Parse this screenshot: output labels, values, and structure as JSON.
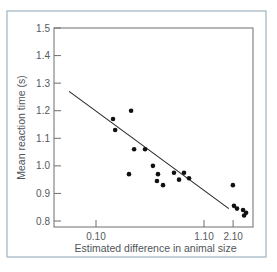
{
  "colors": {
    "frame": "#9fb3bf",
    "plot_border": "#6e6e6e",
    "axis": "#6e6e6e",
    "point": "#111111",
    "line": "#2a2a2a",
    "text": "#555a5e"
  },
  "chart_data": {
    "type": "scatter",
    "title": "",
    "xlabel": "Estimated difference in animal size",
    "ylabel": "Mean reaction time (s)",
    "xscale": "log",
    "xlim": [
      0.04,
      3.5
    ],
    "ylim": [
      0.8,
      1.5
    ],
    "grid": false,
    "legend": null,
    "x_ticks": [
      {
        "value": 0.1,
        "label": "0.10"
      },
      {
        "value": 1.1,
        "label": "1.10"
      },
      {
        "value": 2.1,
        "label": "2.10"
      }
    ],
    "y_ticks": [
      {
        "value": 0.8,
        "label": "0.8"
      },
      {
        "value": 0.9,
        "label": "0.9"
      },
      {
        "value": 1.0,
        "label": "1.0"
      },
      {
        "value": 1.1,
        "label": "1.1"
      },
      {
        "value": 1.2,
        "label": "1.2"
      },
      {
        "value": 1.3,
        "label": "1.3"
      },
      {
        "value": 1.4,
        "label": "1.4"
      },
      {
        "value": 1.5,
        "label": "1.5"
      }
    ],
    "series": [
      {
        "name": "observations",
        "points": [
          {
            "x": 0.146,
            "y": 1.17
          },
          {
            "x": 0.218,
            "y": 1.2
          },
          {
            "x": 0.153,
            "y": 1.13
          },
          {
            "x": 0.233,
            "y": 1.06
          },
          {
            "x": 0.297,
            "y": 1.06
          },
          {
            "x": 0.208,
            "y": 0.97
          },
          {
            "x": 0.354,
            "y": 1.0
          },
          {
            "x": 0.396,
            "y": 0.97
          },
          {
            "x": 0.387,
            "y": 0.945
          },
          {
            "x": 0.443,
            "y": 0.93
          },
          {
            "x": 0.565,
            "y": 0.975
          },
          {
            "x": 0.706,
            "y": 0.975
          },
          {
            "x": 0.632,
            "y": 0.95
          },
          {
            "x": 0.789,
            "y": 0.955
          },
          {
            "x": 2.09,
            "y": 0.93
          },
          {
            "x": 2.14,
            "y": 0.855
          },
          {
            "x": 2.29,
            "y": 0.845
          },
          {
            "x": 2.62,
            "y": 0.84
          },
          {
            "x": 2.8,
            "y": 0.83
          },
          {
            "x": 2.68,
            "y": 0.82
          }
        ]
      }
    ],
    "fit_line": {
      "name": "regression",
      "start": {
        "x": 0.055,
        "y": 1.27
      },
      "end": {
        "x": 1.91,
        "y": 0.845
      }
    }
  },
  "layout": {
    "frame": {
      "x": 7,
      "y": 11,
      "w": 259,
      "h": 246
    },
    "plot": {
      "left": 54,
      "top": 28,
      "right": 253,
      "bottom": 227
    },
    "y_px": {
      "v0": 0.8,
      "p0": 221,
      "per_unit": 275.7
    },
    "x_px": {
      "ref": 0.1,
      "p0": 96,
      "per_decade": 103.7
    }
  }
}
